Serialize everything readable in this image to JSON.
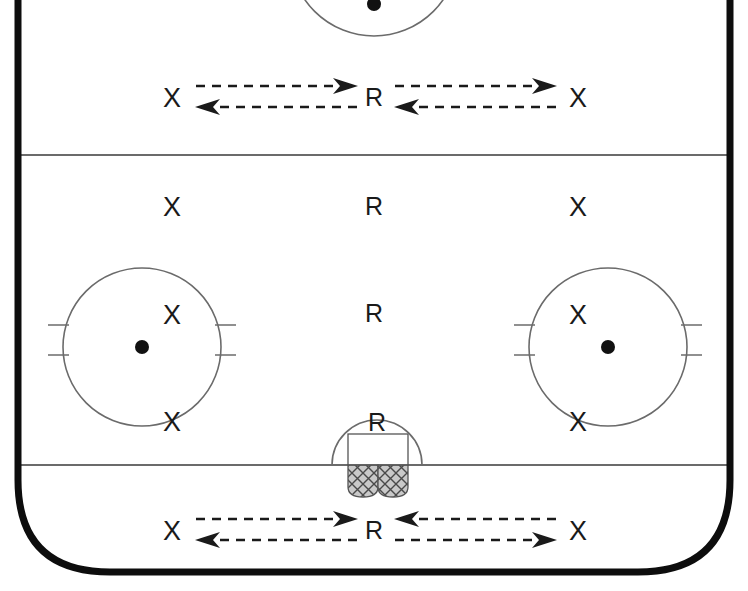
{
  "diagram": {
    "type": "ice-hockey-rink-drill",
    "colors": {
      "boards": "#0d0d0d",
      "ice": "#ffffff",
      "line": "#6b6b6b",
      "marker": "#1a1a1a",
      "net_fill": "#b8b8b8"
    },
    "zones": [
      {
        "name": "top-attacking-zone"
      },
      {
        "name": "neutral-zone"
      },
      {
        "name": "bottom-defending-zone"
      }
    ]
  },
  "markers": [
    {
      "id": "x-top-left",
      "label": "X",
      "kind": "x",
      "x": 172,
      "y": 98,
      "zone": "top-attacking-zone"
    },
    {
      "id": "r-top-center",
      "label": "R",
      "kind": "r",
      "x": 374,
      "y": 97,
      "zone": "top-attacking-zone"
    },
    {
      "id": "x-top-right",
      "label": "X",
      "kind": "x",
      "x": 578,
      "y": 98,
      "zone": "top-attacking-zone"
    },
    {
      "id": "x-neutral-left",
      "label": "X",
      "kind": "x",
      "x": 172,
      "y": 207,
      "zone": "neutral-zone"
    },
    {
      "id": "r-neutral-upper",
      "label": "R",
      "kind": "r",
      "x": 374,
      "y": 206,
      "zone": "neutral-zone"
    },
    {
      "id": "x-neutral-right",
      "label": "X",
      "kind": "x",
      "x": 578,
      "y": 207,
      "zone": "neutral-zone"
    },
    {
      "id": "x-circle-left-top",
      "label": "X",
      "kind": "x",
      "x": 172,
      "y": 315,
      "zone": "left-faceoff-circle"
    },
    {
      "id": "r-center-lower",
      "label": "R",
      "kind": "r",
      "x": 374,
      "y": 313,
      "zone": "neutral-zone"
    },
    {
      "id": "x-circle-right-top",
      "label": "X",
      "kind": "x",
      "x": 578,
      "y": 315,
      "zone": "right-faceoff-circle"
    },
    {
      "id": "x-circle-left-bottom",
      "label": "X",
      "kind": "x",
      "x": 172,
      "y": 422,
      "zone": "left-faceoff-circle"
    },
    {
      "id": "r-goal-crease",
      "label": "R",
      "kind": "r",
      "x": 377,
      "y": 422,
      "zone": "bottom-defending-zone"
    },
    {
      "id": "x-circle-right-bottom",
      "label": "X",
      "kind": "x",
      "x": 578,
      "y": 422,
      "zone": "right-faceoff-circle"
    },
    {
      "id": "x-bottom-left",
      "label": "X",
      "kind": "x",
      "x": 172,
      "y": 531,
      "zone": "bottom-defending-zone"
    },
    {
      "id": "r-bottom-center",
      "label": "R",
      "kind": "r",
      "x": 374,
      "y": 530,
      "zone": "bottom-defending-zone"
    },
    {
      "id": "x-bottom-right",
      "label": "X",
      "kind": "x",
      "x": 578,
      "y": 531,
      "zone": "bottom-defending-zone"
    }
  ],
  "arrows": [
    {
      "id": "arrow-top-left-out",
      "style": "dashed",
      "direction": "right",
      "from": [
        196,
        86
      ],
      "to": [
        357,
        86
      ]
    },
    {
      "id": "arrow-top-left-back",
      "style": "dashed",
      "direction": "left",
      "from": [
        357,
        107
      ],
      "to": [
        196,
        107
      ]
    },
    {
      "id": "arrow-top-right-out",
      "style": "dashed",
      "direction": "right",
      "from": [
        395,
        86
      ],
      "to": [
        556,
        86
      ]
    },
    {
      "id": "arrow-top-right-back",
      "style": "dashed",
      "direction": "left",
      "from": [
        556,
        107
      ],
      "to": [
        395,
        107
      ]
    },
    {
      "id": "arrow-bottom-left-out",
      "style": "dashed",
      "direction": "right",
      "from": [
        196,
        519
      ],
      "to": [
        357,
        519
      ]
    },
    {
      "id": "arrow-bottom-left-back",
      "style": "dashed",
      "direction": "left",
      "from": [
        357,
        540
      ],
      "to": [
        196,
        540
      ]
    },
    {
      "id": "arrow-bottom-right-in",
      "style": "dashed",
      "direction": "left",
      "from": [
        556,
        519
      ],
      "to": [
        395,
        519
      ]
    },
    {
      "id": "arrow-bottom-right-out",
      "style": "dashed",
      "direction": "right",
      "from": [
        395,
        540
      ],
      "to": [
        556,
        540
      ]
    }
  ],
  "rink_features": {
    "top_faceoff_circle": {
      "name": "top-faceoff-circle",
      "cx": 374,
      "cy": -48,
      "r": 84,
      "dot": [
        374,
        4
      ]
    },
    "left_faceoff_circle": {
      "name": "left-faceoff-circle",
      "cx": 142,
      "cy": 347,
      "r": 79,
      "dot": [
        142,
        347
      ]
    },
    "right_faceoff_circle": {
      "name": "right-faceoff-circle",
      "cx": 608,
      "cy": 347,
      "r": 79,
      "dot": [
        608,
        347
      ]
    },
    "blue_line_top": {
      "name": "blue-line-top",
      "y": 155
    },
    "goal_line_bottom": {
      "name": "goal-line-bottom",
      "y": 465
    },
    "goal_crease": {
      "name": "goal-crease-arc",
      "cx": 377,
      "cy": 465,
      "r": 45
    },
    "goal_net": {
      "name": "goal-net",
      "x": 348,
      "y": 434,
      "width": 60,
      "height": 58
    }
  }
}
